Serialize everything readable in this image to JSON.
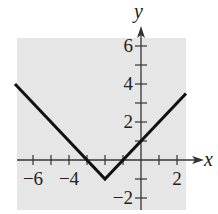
{
  "chart_data": {
    "type": "line",
    "title": "",
    "xlabel": "x",
    "ylabel": "y",
    "xlim": [
      -7,
      2.5
    ],
    "ylim": [
      -2.6,
      7
    ],
    "grid": false,
    "background": "#e6e6e6",
    "line_color": "#111111",
    "x_ticks": [
      -6,
      -5,
      -4,
      -3,
      -2,
      -1,
      1,
      2
    ],
    "y_ticks": [
      -2,
      -1,
      1,
      2,
      3,
      4,
      5,
      6
    ],
    "x_tick_labels": [
      {
        "value": -6,
        "text": "−6"
      },
      {
        "value": -4,
        "text": "−4"
      },
      {
        "value": 2,
        "text": "2"
      }
    ],
    "y_tick_labels": [
      {
        "value": 6,
        "text": "6"
      },
      {
        "value": 4,
        "text": "4"
      },
      {
        "value": 2,
        "text": "2"
      },
      {
        "value": -2,
        "text": "−2"
      }
    ],
    "series": [
      {
        "name": "y = |x + 2| - 1",
        "x": [
          -7,
          -2,
          2.5
        ],
        "y": [
          4,
          -1,
          3.5
        ]
      }
    ]
  }
}
